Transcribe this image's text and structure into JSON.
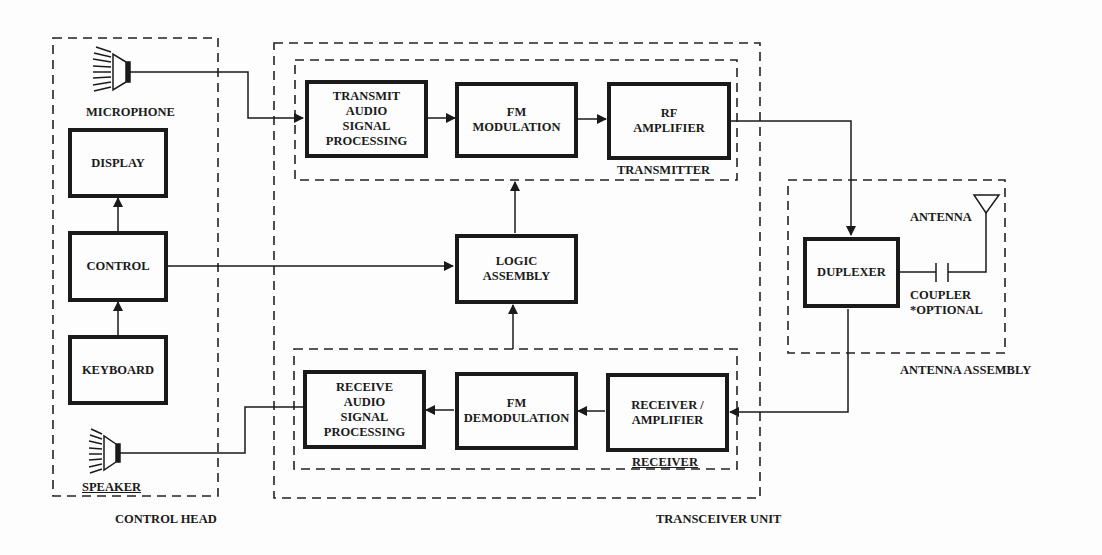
{
  "diagram": {
    "groups": {
      "control_head": {
        "label": "CONTROL HEAD"
      },
      "transceiver_unit": {
        "label": "TRANSCEIVER UNIT"
      },
      "transmitter": {
        "label": "TRANSMITTER"
      },
      "receiver": {
        "label": "RECEIVER"
      },
      "antenna_assembly": {
        "label": "ANTENNA ASSEMBLY"
      }
    },
    "components": {
      "microphone": {
        "label": "MICROPHONE"
      },
      "speaker": {
        "label": "SPEAKER"
      },
      "antenna": {
        "label": "ANTENNA"
      },
      "coupler": {
        "label": "COUPLER\n*OPTIONAL"
      }
    },
    "blocks": {
      "display": "DISPLAY",
      "control": "CONTROL",
      "keyboard": "KEYBOARD",
      "tx_audio": "TRANSMIT\nAUDIO\nSIGNAL\nPROCESSING",
      "fm_mod": "FM\nMODULATION",
      "rf_amp": "RF\nAMPLIFIER",
      "logic": "LOGIC\nASSEMBLY",
      "rx_audio": "RECEIVE\nAUDIO\nSIGNAL\nPROCESSING",
      "fm_demod": "FM\nDEMODULATION",
      "rx_amp": "RECEIVER /\nAMPLIFIER",
      "duplexer": "DUPLEXER"
    },
    "connections": [
      {
        "from": "microphone",
        "to": "tx_audio"
      },
      {
        "from": "tx_audio",
        "to": "fm_mod"
      },
      {
        "from": "fm_mod",
        "to": "rf_amp"
      },
      {
        "from": "rf_amp",
        "to": "duplexer"
      },
      {
        "from": "duplexer",
        "to": "rx_amp"
      },
      {
        "from": "rx_amp",
        "to": "fm_demod"
      },
      {
        "from": "fm_demod",
        "to": "rx_audio"
      },
      {
        "from": "rx_audio",
        "to": "speaker"
      },
      {
        "from": "logic",
        "to": "transmitter"
      },
      {
        "from": "receiver",
        "to": "logic"
      },
      {
        "from": "control",
        "to": "logic",
        "bidirectional": true
      },
      {
        "from": "control",
        "to": "display"
      },
      {
        "from": "keyboard",
        "to": "control"
      },
      {
        "from": "duplexer",
        "to": "antenna",
        "via": "coupler"
      }
    ]
  }
}
